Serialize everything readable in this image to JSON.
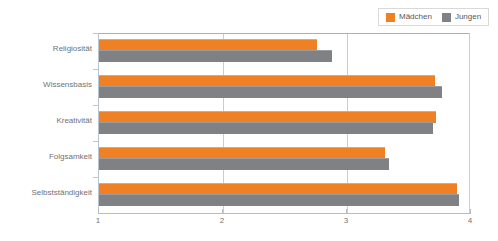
{
  "chart_data": {
    "type": "bar",
    "orientation": "horizontal",
    "title": "",
    "subtitle": "",
    "xlabel": "",
    "ylabel": "",
    "xlim": [
      1,
      4
    ],
    "xticks": [
      "1",
      "2",
      "3",
      "4"
    ],
    "grid": true,
    "grid_axis": "x",
    "legend_position": "top-right",
    "categories": [
      "Religiosität",
      "Wissensbasis",
      "Kreativität",
      "Folgsamkeit",
      "Selbstständigkeit"
    ],
    "series": [
      {
        "name": "Mädchen",
        "color": "#ef8024",
        "values": [
          2.76,
          3.71,
          3.72,
          3.31,
          3.89
        ]
      },
      {
        "name": "Jungen",
        "color": "#808184",
        "values": [
          2.88,
          3.77,
          3.69,
          3.34,
          3.9
        ]
      }
    ]
  },
  "legend": {
    "entries": [
      {
        "label": "Mädchen",
        "swatch": "legend-swatch-orange"
      },
      {
        "label": "Jungen",
        "swatch": "legend-swatch-gray"
      }
    ]
  },
  "axis": {
    "x_tick_labels": [
      "1",
      "2",
      "3",
      "4"
    ]
  },
  "colors": {
    "girls": "#ef8024",
    "boys": "#808184",
    "gridline": "#c9ccd1",
    "axis": "#b8bcc2",
    "text": "#6f7276",
    "background": "#ffffff"
  }
}
